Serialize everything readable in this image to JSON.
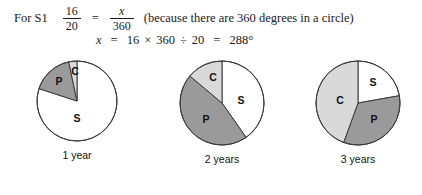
{
  "worked_solution": {
    "lead_label": "For S1",
    "line1": {
      "fraction_left": {
        "numerator": "16",
        "denominator": "20"
      },
      "equals": "=",
      "fraction_right": {
        "numerator": "x",
        "denominator": "360"
      },
      "note": "(because there are 360 degrees in a circle)"
    },
    "line2": {
      "variable": "x",
      "equals_1": "=",
      "a": "16",
      "times": "×",
      "b": "360",
      "divide": "÷",
      "c": "20",
      "equals_2": "=",
      "result": "288°"
    }
  },
  "colors": {
    "slice_s": "#ffffff",
    "slice_p": "#9a9a9a",
    "slice_c": "#d9d9d9",
    "outline": "#3a3a3a",
    "text": "#111111",
    "background": "#ffffff"
  },
  "chart_data": {
    "type": "pie",
    "title": "",
    "legend_position": "inside-slices",
    "categories": [
      "S",
      "P",
      "C"
    ],
    "charts": [
      {
        "caption": "1 year",
        "radius": 40,
        "slices": [
          {
            "label": "S",
            "degrees": 288,
            "start": 0,
            "end": 288,
            "color": "#ffffff",
            "label_x": 0,
            "label_y": 18
          },
          {
            "label": "P",
            "degrees": 60,
            "start": 288,
            "end": 348,
            "color": "#9a9a9a",
            "label_x": -18,
            "label_y": -19
          },
          {
            "label": "C",
            "degrees": 12,
            "start": 348,
            "end": 360,
            "color": "#d9d9d9",
            "label_x": -2,
            "label_y": -29
          }
        ]
      },
      {
        "caption": "2 years",
        "radius": 42,
        "slices": [
          {
            "label": "S",
            "degrees": 145,
            "start": 0,
            "end": 145,
            "color": "#ffffff",
            "label_x": 19,
            "label_y": -2
          },
          {
            "label": "P",
            "degrees": 165,
            "start": 145,
            "end": 310,
            "color": "#9a9a9a",
            "label_x": -16,
            "label_y": 17
          },
          {
            "label": "C",
            "degrees": 50,
            "start": 310,
            "end": 360,
            "color": "#d9d9d9",
            "label_x": -9,
            "label_y": -25
          }
        ]
      },
      {
        "caption": "3 years",
        "radius": 42,
        "slices": [
          {
            "label": "S",
            "degrees": 80,
            "start": 0,
            "end": 80,
            "color": "#ffffff",
            "label_x": 15,
            "label_y": -20
          },
          {
            "label": "P",
            "degrees": 120,
            "start": 80,
            "end": 200,
            "color": "#9a9a9a",
            "label_x": 16,
            "label_y": 17
          },
          {
            "label": "C",
            "degrees": 160,
            "start": 200,
            "end": 360,
            "color": "#d9d9d9",
            "label_x": -18,
            "label_y": -2
          }
        ]
      }
    ]
  }
}
